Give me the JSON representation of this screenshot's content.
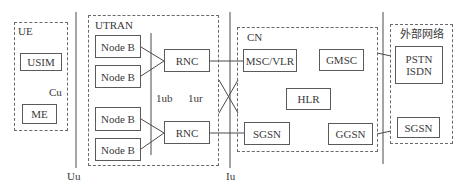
{
  "diagram": {
    "groups": {
      "ue": {
        "label": "UE"
      },
      "utran": {
        "label": "UTRAN"
      },
      "cn": {
        "label": "CN"
      },
      "external": {
        "label": "外部网络"
      }
    },
    "nodes": {
      "usim": "USIM",
      "me": "ME",
      "nodeb_1": "Node B",
      "nodeb_2": "Node B",
      "nodeb_3": "Node B",
      "nodeb_4": "Node B",
      "rnc_1": "RNC",
      "rnc_2": "RNC",
      "msc_vlr": "MSC/VLR",
      "gmsc": "GMSC",
      "hlr": "HLR",
      "sgsn": "SGSN",
      "ggsn": "GGSN",
      "pstn": "PSTN",
      "isdn": "ISDN",
      "ext_sgsn": "SGSN"
    },
    "interfaces": {
      "cu": "Cu",
      "uu": "Uu",
      "iub": "1ub",
      "iur": "1ur",
      "iu": "Iu"
    },
    "edges": [
      [
        "nodeb_1",
        "rnc_1"
      ],
      [
        "nodeb_2",
        "rnc_1"
      ],
      [
        "nodeb_3",
        "rnc_2"
      ],
      [
        "nodeb_4",
        "rnc_2"
      ],
      [
        "rnc_1",
        "msc_vlr"
      ],
      [
        "rnc_2",
        "sgsn"
      ],
      [
        "rnc_1",
        "sgsn"
      ],
      [
        "rnc_2",
        "msc_vlr"
      ],
      [
        "gmsc",
        "pstn_isdn"
      ],
      [
        "ggsn",
        "ext_sgsn"
      ]
    ]
  }
}
